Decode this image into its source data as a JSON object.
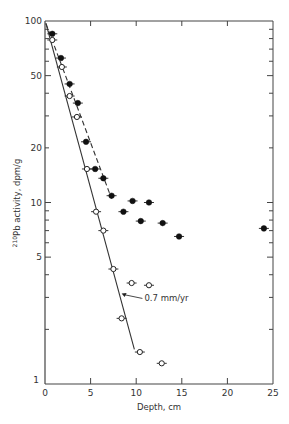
{
  "chart_data": {
    "type": "scatter",
    "title": "",
    "xlabel": "Depth, cm",
    "ylabel_sup": "210",
    "ylabel": "Pb activity, dpm/g",
    "xlim": [
      0,
      25
    ],
    "ylim": [
      1,
      100
    ],
    "yscale": "log",
    "grid": false,
    "x_ticks": [
      0,
      5,
      10,
      15,
      20,
      25
    ],
    "x_tick_labels": [
      "0",
      "5",
      "10",
      "15",
      "20",
      "25"
    ],
    "y_ticks": [
      1,
      5,
      10,
      20,
      50,
      100
    ],
    "y_tick_labels": [
      "1",
      "5",
      "10",
      "20",
      "50",
      "100"
    ],
    "series": [
      {
        "name": "filled",
        "marker": "filled-circle",
        "points": [
          [
            0.8,
            85
          ],
          [
            1.75,
            62.5
          ],
          [
            2.7,
            45
          ],
          [
            3.6,
            35.3
          ],
          [
            4.5,
            21.6
          ],
          [
            5.5,
            15.3
          ],
          [
            6.4,
            13.6
          ],
          [
            7.3,
            10.9
          ],
          [
            8.6,
            8.9
          ],
          [
            9.6,
            10.2
          ],
          [
            10.5,
            7.9
          ],
          [
            11.4,
            10.0
          ],
          [
            12.9,
            7.7
          ],
          [
            14.7,
            6.5
          ],
          [
            24.0,
            7.2
          ]
        ]
      },
      {
        "name": "open",
        "marker": "open-circle",
        "points": [
          [
            0.8,
            78.6
          ],
          [
            1.85,
            55.8
          ],
          [
            2.7,
            38.6
          ],
          [
            3.5,
            29.6
          ],
          [
            4.6,
            15.3
          ],
          [
            5.6,
            8.9
          ],
          [
            6.4,
            7.0
          ],
          [
            7.5,
            4.3
          ],
          [
            8.4,
            2.3
          ],
          [
            9.5,
            3.6
          ],
          [
            10.4,
            1.5
          ],
          [
            11.4,
            3.5
          ],
          [
            12.8,
            1.3
          ]
        ]
      }
    ],
    "fit_lines": [
      {
        "name": "solid-fit",
        "style": "solid",
        "points": [
          [
            0.1,
            97
          ],
          [
            9.8,
            1.55
          ]
        ]
      },
      {
        "name": "dashed-fit",
        "style": "dashed",
        "points": [
          [
            0.1,
            97
          ],
          [
            7.3,
            10.5
          ]
        ]
      }
    ],
    "annotations": [
      {
        "text": "0.7 mm/yr",
        "at": [
          10.9,
          2.85
        ],
        "arrow_to": [
          8.4,
          3.15
        ]
      }
    ]
  }
}
